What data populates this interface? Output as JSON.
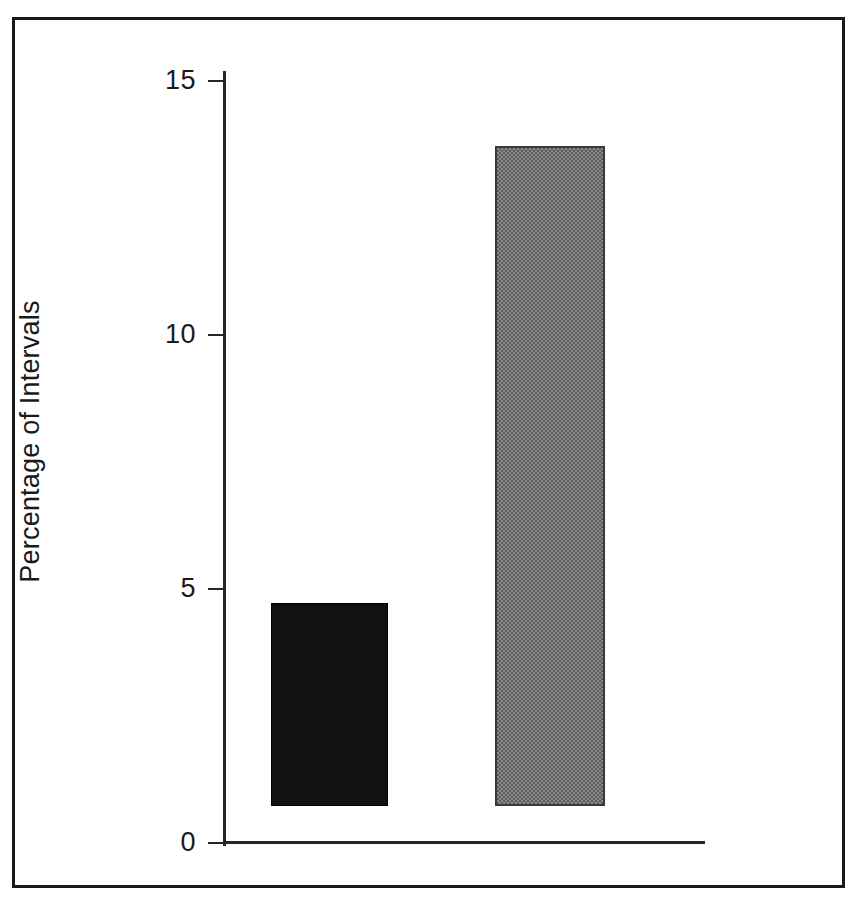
{
  "chart_data": {
    "type": "bar",
    "title": "",
    "subtitle": "",
    "xlabel": "",
    "ylabel": "Percentage of Intervals",
    "categories": [
      "",
      ""
    ],
    "values": [
      4,
      13
    ],
    "series": [
      {
        "name": "",
        "values": [
          4,
          13
        ]
      }
    ],
    "bars": [
      {
        "label": "",
        "value": 4,
        "fill": "solid-black",
        "color": "#111111"
      },
      {
        "label": "",
        "value": 13,
        "fill": "gray-dither-50",
        "color": "#808080"
      }
    ],
    "ylim": [
      0,
      15
    ],
    "yticks": [
      0,
      5,
      10,
      15
    ],
    "ytick_labels": [
      "0",
      "5",
      "10",
      "15"
    ],
    "xticks": [],
    "xtick_labels": [],
    "grid": false,
    "legend": null,
    "legend_position": "none",
    "annotations": [],
    "axis_color": "#262626",
    "background_color": "#ffffff",
    "frame_color": "#1a1a1a"
  },
  "figure": {
    "border_color": "#1a1a1a",
    "has_outer_frame": true
  }
}
